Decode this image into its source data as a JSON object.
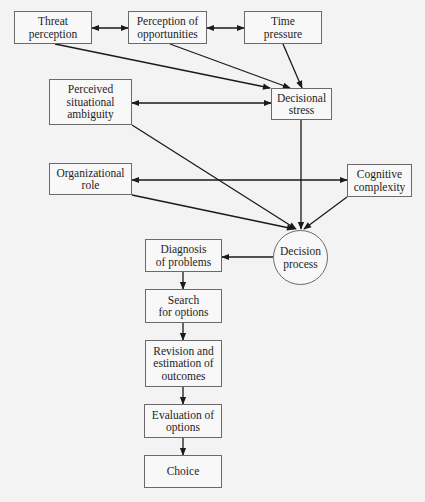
{
  "diagram": {
    "type": "flowchart",
    "colors": {
      "background": "#f3f3f3",
      "border": "#6a6a6a",
      "line": "#1a1a1a",
      "text": "#1e1e1e"
    },
    "nodes": [
      {
        "id": "threat",
        "label": "Threat\nperception",
        "shape": "rect",
        "x": 14,
        "y": 11,
        "w": 78,
        "h": 33
      },
      {
        "id": "opportunities",
        "label": "Perception of\nopportunities",
        "shape": "rect",
        "x": 128,
        "y": 11,
        "w": 79,
        "h": 33
      },
      {
        "id": "time",
        "label": "Time\npressure",
        "shape": "rect",
        "x": 244,
        "y": 11,
        "w": 78,
        "h": 33
      },
      {
        "id": "ambiguity",
        "label": "Perceived\nsituational\nambiguity",
        "shape": "rect",
        "x": 49,
        "y": 79,
        "w": 83,
        "h": 46
      },
      {
        "id": "stress",
        "label": "Decisional\nstress",
        "shape": "rect",
        "x": 271,
        "y": 88,
        "w": 61,
        "h": 32
      },
      {
        "id": "role",
        "label": "Organizational\nrole",
        "shape": "rect",
        "x": 49,
        "y": 163,
        "w": 83,
        "h": 32
      },
      {
        "id": "cognitive",
        "label": "Cognitive\ncomplexity",
        "shape": "rect",
        "x": 347,
        "y": 164,
        "w": 65,
        "h": 33
      },
      {
        "id": "process",
        "label": "Decision\nprocess",
        "shape": "circle",
        "x": 273,
        "y": 230,
        "w": 55,
        "h": 55
      },
      {
        "id": "diagnosis",
        "label": "Diagnosis\nof problems",
        "shape": "rect",
        "x": 145,
        "y": 239,
        "w": 77,
        "h": 33
      },
      {
        "id": "search",
        "label": "Search\nfor options",
        "shape": "rect",
        "x": 145,
        "y": 289,
        "w": 77,
        "h": 34
      },
      {
        "id": "revision",
        "label": "Revision and\nestimation of\noutcomes",
        "shape": "rect",
        "x": 145,
        "y": 340,
        "w": 77,
        "h": 47
      },
      {
        "id": "evaluation",
        "label": "Evaluation of\noptions",
        "shape": "rect",
        "x": 144,
        "y": 404,
        "w": 78,
        "h": 34
      },
      {
        "id": "choice",
        "label": "Choice",
        "shape": "rect",
        "x": 144,
        "y": 455,
        "w": 78,
        "h": 33
      }
    ],
    "edges": [
      {
        "from": "threat",
        "to": "opportunities",
        "bidirectional": true,
        "points": [
          [
            92,
            28
          ],
          [
            128,
            28
          ]
        ]
      },
      {
        "from": "opportunities",
        "to": "time",
        "bidirectional": true,
        "points": [
          [
            207,
            28
          ],
          [
            244,
            28
          ]
        ]
      },
      {
        "from": "threat",
        "to": "stress",
        "bidirectional": false,
        "points": [
          [
            55,
            44
          ],
          [
            270,
            88
          ]
        ]
      },
      {
        "from": "opportunities",
        "to": "stress",
        "bidirectional": false,
        "points": [
          [
            170,
            44
          ],
          [
            290,
            88
          ]
        ]
      },
      {
        "from": "time",
        "to": "stress",
        "bidirectional": false,
        "points": [
          [
            283,
            44
          ],
          [
            302,
            88
          ]
        ]
      },
      {
        "from": "ambiguity",
        "to": "stress",
        "bidirectional": true,
        "points": [
          [
            132,
            103
          ],
          [
            271,
            103
          ]
        ]
      },
      {
        "from": "ambiguity",
        "to": "process",
        "bidirectional": false,
        "points": [
          [
            132,
            125
          ],
          [
            296,
            229
          ]
        ]
      },
      {
        "from": "stress",
        "to": "process",
        "bidirectional": false,
        "points": [
          [
            301,
            120
          ],
          [
            301,
            229
          ]
        ]
      },
      {
        "from": "role",
        "to": "cognitive",
        "bidirectional": true,
        "points": [
          [
            132,
            180
          ],
          [
            347,
            180
          ]
        ]
      },
      {
        "from": "role",
        "to": "process",
        "bidirectional": false,
        "points": [
          [
            132,
            195
          ],
          [
            294,
            229
          ]
        ]
      },
      {
        "from": "cognitive",
        "to": "process",
        "bidirectional": false,
        "points": [
          [
            347,
            197
          ],
          [
            304,
            229
          ]
        ]
      },
      {
        "from": "process",
        "to": "diagnosis",
        "bidirectional": false,
        "points": [
          [
            273,
            257
          ],
          [
            222,
            257
          ]
        ]
      },
      {
        "from": "diagnosis",
        "to": "search",
        "bidirectional": false,
        "points": [
          [
            183,
            272
          ],
          [
            183,
            289
          ]
        ]
      },
      {
        "from": "search",
        "to": "revision",
        "bidirectional": false,
        "points": [
          [
            183,
            323
          ],
          [
            183,
            340
          ]
        ]
      },
      {
        "from": "revision",
        "to": "evaluation",
        "bidirectional": false,
        "points": [
          [
            183,
            387
          ],
          [
            183,
            404
          ]
        ]
      },
      {
        "from": "evaluation",
        "to": "choice",
        "bidirectional": false,
        "points": [
          [
            183,
            438
          ],
          [
            183,
            455
          ]
        ]
      }
    ]
  }
}
